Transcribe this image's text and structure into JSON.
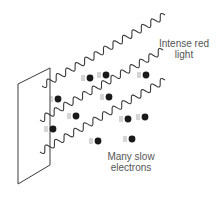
{
  "diagram": {
    "type": "photoelectric-effect",
    "labels": {
      "light": [
        "Intense red",
        "light"
      ],
      "electrons": [
        "Many slow",
        "electrons"
      ]
    },
    "colors": {
      "line": "#3a3a3a",
      "electron": "#1a1a1a",
      "text": "#555555",
      "background": "#ffffff"
    },
    "plate": {
      "points": [
        [
          18,
          84
        ],
        [
          50,
          68
        ],
        [
          50,
          165
        ],
        [
          18,
          184
        ]
      ]
    },
    "waves": [
      {
        "start": [
          42,
          86
        ],
        "end": [
          165,
          15
        ],
        "cycles": 13
      },
      {
        "start": [
          40,
          120
        ],
        "end": [
          163,
          50
        ],
        "cycles": 13
      },
      {
        "start": [
          40,
          152
        ],
        "end": [
          165,
          80
        ],
        "cycles": 13
      }
    ],
    "electrons": [
      {
        "x": 90,
        "y": 78
      },
      {
        "x": 106,
        "y": 75
      },
      {
        "x": 146,
        "y": 75
      },
      {
        "x": 58,
        "y": 99
      },
      {
        "x": 109,
        "y": 97
      },
      {
        "x": 76,
        "y": 116
      },
      {
        "x": 128,
        "y": 119
      },
      {
        "x": 145,
        "y": 117
      },
      {
        "x": 53,
        "y": 129
      },
      {
        "x": 98,
        "y": 141
      },
      {
        "x": 132,
        "y": 139
      }
    ]
  }
}
